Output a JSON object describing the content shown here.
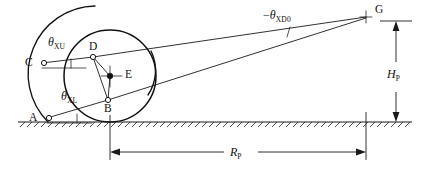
{
  "figure": {
    "type": "engineering-kinematic-diagram",
    "background_color": "#ffffff",
    "line_color": "#1a1a1a"
  },
  "points": {
    "A": {
      "label": "A",
      "role": "lower-chassis-pivot",
      "x": 44,
      "y": 118
    },
    "B": {
      "label": "B",
      "role": "lower-knuckle-joint",
      "x": 108,
      "y": 100
    },
    "C": {
      "label": "C",
      "role": "upper-chassis-pivot",
      "x": 39,
      "y": 63
    },
    "D": {
      "label": "D",
      "role": "upper-knuckle-joint",
      "x": 93,
      "y": 57
    },
    "E": {
      "label": "E",
      "role": "wheel-center",
      "x": 110,
      "y": 76
    },
    "G": {
      "label": "G",
      "role": "instant-centre-pitch-pole",
      "x": 366,
      "y": 17
    }
  },
  "angles": {
    "theta_xu": {
      "symbol": "θ",
      "subscript": "XU",
      "sign": "",
      "at_point": "C",
      "description": "upper-arm inclination angle"
    },
    "theta_xl": {
      "symbol": "θ",
      "subscript": "XL",
      "sign": "",
      "at_point": "A",
      "description": "lower-arm inclination angle"
    },
    "theta_xd0": {
      "symbol": "θ",
      "subscript": "XD0",
      "sign": "−",
      "at_point": "G",
      "description": "included angle at pitch pole"
    }
  },
  "dimensions": {
    "H_P": {
      "symbol": "H",
      "subscript": "P",
      "orientation": "vertical",
      "description": "pitch pole height above ground"
    },
    "R_P": {
      "symbol": "R",
      "subscript": "P",
      "orientation": "horizontal",
      "description": "pitch pole longitudinal distance from contact patch"
    }
  },
  "wheel": {
    "center_x": 110,
    "center_y": 76,
    "radius": 46,
    "contact_patch_x": 110,
    "ground_y": 122
  },
  "ground": {
    "y": 122,
    "x_start": 18,
    "x_end": 412,
    "hatch_direction": "down-right"
  }
}
